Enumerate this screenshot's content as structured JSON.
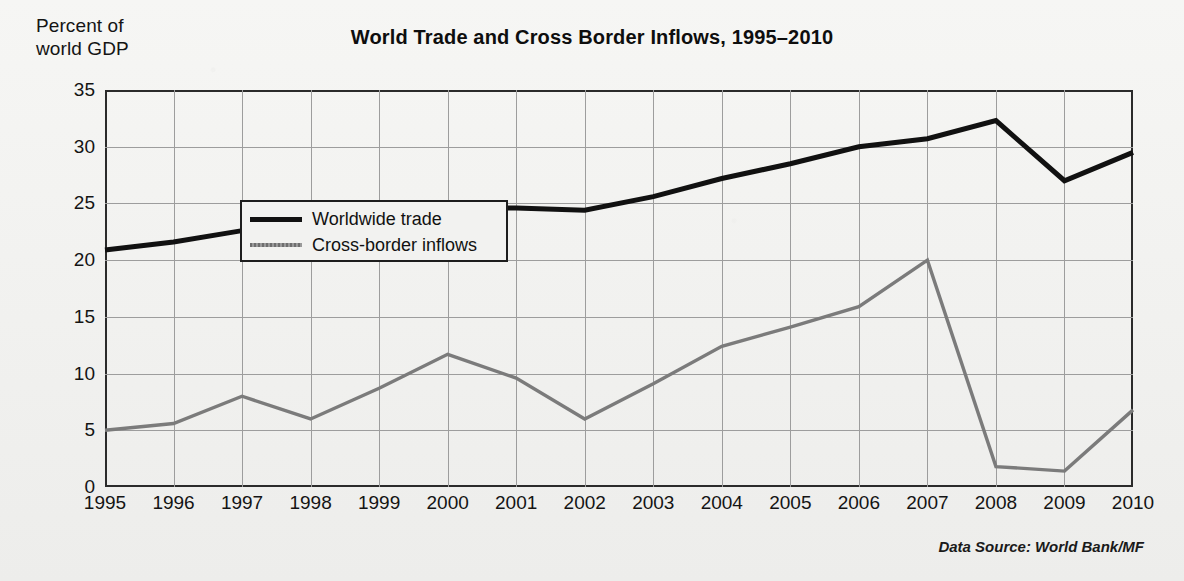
{
  "header": {
    "title": "World Trade and Cross Border Inflows, 1995–2010",
    "axis_caption": "Percent of\nworld GDP"
  },
  "footer": {
    "source_note": "Data Source: World Bank/MF"
  },
  "legend": {
    "position": "inside-top-left",
    "entries": [
      {
        "label": "Worldwide trade",
        "swatch": "trade",
        "color": "#111111"
      },
      {
        "label": "Cross-border inflows",
        "swatch": "inflow",
        "color": "#7b7b7b"
      }
    ]
  },
  "colors": {
    "trade_line": "#111111",
    "inflow_line": "#7b7b7b",
    "grid": "#9d9d9d",
    "frame": "#2b2b2b",
    "paper": "#f2f2f0",
    "text": "#141414"
  },
  "chart_data": {
    "type": "line",
    "title": "World Trade and Cross Border Inflows, 1995–2010",
    "subtitle": "",
    "xlabel": "",
    "ylabel": "Percent of world GDP",
    "xlim": [
      1995,
      2010
    ],
    "ylim": [
      0,
      35
    ],
    "ytick_step": 5,
    "grid": true,
    "legend_position": "inside-top-left",
    "annotations": [
      "Data Source: World Bank/MF"
    ],
    "categories": [
      "1995",
      "1996",
      "1997",
      "1998",
      "1999",
      "2000",
      "2001",
      "2002",
      "2003",
      "2004",
      "2005",
      "2006",
      "2007",
      "2008",
      "2009",
      "2010"
    ],
    "x": [
      1995,
      1996,
      1997,
      1998,
      1999,
      2000,
      2001,
      2002,
      2003,
      2004,
      2005,
      2006,
      2007,
      2008,
      2009,
      2010
    ],
    "yticks": [
      0,
      5,
      10,
      15,
      20,
      25,
      30,
      35
    ],
    "series": [
      {
        "name": "Worldwide trade",
        "color": "#111111",
        "values": [
          20.9,
          21.6,
          22.6,
          22.4,
          22.4,
          24.6,
          24.6,
          24.4,
          25.6,
          27.2,
          28.5,
          30.0,
          30.7,
          32.3,
          27.0,
          29.5
        ]
      },
      {
        "name": "Cross-border inflows",
        "color": "#7b7b7b",
        "values": [
          5.0,
          5.6,
          8.0,
          6.0,
          8.7,
          11.7,
          9.6,
          6.0,
          9.1,
          12.4,
          14.1,
          15.9,
          20.0,
          1.8,
          1.4,
          6.8
        ]
      }
    ]
  }
}
